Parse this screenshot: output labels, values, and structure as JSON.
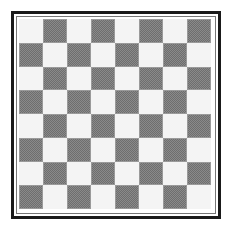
{
  "board": {
    "rows": 8,
    "columns": 8,
    "top_left_color": "light",
    "colors": {
      "light": "#f4f4f4",
      "dark": "#8a8a8a",
      "frame_outer": "#1a1a1a",
      "frame_inner": "#777777"
    }
  }
}
